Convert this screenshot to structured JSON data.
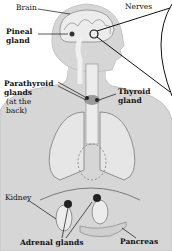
{
  "diagram": {
    "labels": {
      "brain": "Brain",
      "nerves": "Nerves",
      "pineal_line1": "Pineal",
      "pineal_line2": "gland",
      "parathyroid_line1": "Parathyroid",
      "parathyroid_line2": "glands",
      "parathyroid_note1": "(at the",
      "parathyroid_note2": "back)",
      "thyroid_line1": "Thyroid",
      "thyroid_line2": "gland",
      "kidney": "Kidney",
      "adrenal": "Adrenal glands",
      "pancreas": "Pancreas"
    },
    "colors": {
      "body": "#d4d4d4",
      "body_outline": "#bdbdbd",
      "organ": "#e8e8e8",
      "organ_outline": "#7a7a7a",
      "gland": "#2a2a2a",
      "line": "#111111"
    }
  }
}
